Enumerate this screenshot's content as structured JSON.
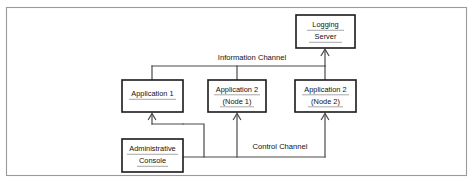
{
  "figure": {
    "type": "block-diagram",
    "background_color": "#ffffff",
    "border_color": "#9a9a9a",
    "node_border_color": "#1a1a1a",
    "connector_color": "#4a4a4a"
  },
  "nodes": [
    {
      "id": "logging-server",
      "line1": "Logging",
      "line2": "Server",
      "x": 296,
      "y": 15,
      "w": 59,
      "h": 33
    },
    {
      "id": "application-1",
      "line1": "Application 1",
      "line2": "",
      "x": 122,
      "y": 80,
      "w": 61,
      "h": 32
    },
    {
      "id": "application-2-node-1",
      "line1": "Application 2",
      "line2": "(Node 1)",
      "x": 208,
      "y": 80,
      "w": 58,
      "h": 32
    },
    {
      "id": "application-2-node-2",
      "line1": "Application 2",
      "line2": "(Node 2)",
      "x": 295,
      "y": 80,
      "w": 61,
      "h": 32
    },
    {
      "id": "administrative-console",
      "line1": "Administrative",
      "line2": "Console",
      "x": 122,
      "y": 139,
      "w": 61,
      "h": 33
    }
  ],
  "channels": [
    {
      "id": "information-channel",
      "label": "Information Channel",
      "label_x": 252,
      "label_y": 58,
      "label_width": 74
    },
    {
      "id": "control-channel",
      "label": "Control Channel",
      "label_x": 280,
      "label_y": 147,
      "label_width": 60
    }
  ]
}
